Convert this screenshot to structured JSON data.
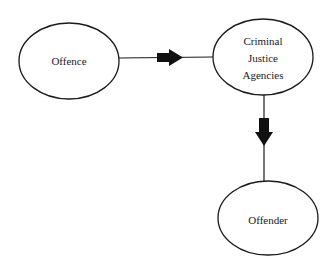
{
  "diagram": {
    "type": "flow",
    "nodes": [
      {
        "id": "offence",
        "label": "Offence",
        "shape": "ellipse",
        "cx": 69,
        "cy": 61,
        "rx": 50,
        "ry": 38
      },
      {
        "id": "cja",
        "label": "Criminal\nJustice\nAgencies",
        "shape": "ellipse",
        "cx": 263,
        "cy": 57,
        "rx": 50,
        "ry": 38
      },
      {
        "id": "offender",
        "label": "Offender",
        "shape": "ellipse",
        "cx": 268,
        "cy": 218,
        "rx": 50,
        "ry": 37
      }
    ],
    "edges": [
      {
        "from": "offence",
        "to": "cja",
        "direction": "right",
        "arrow": "block"
      },
      {
        "from": "cja",
        "to": "offender",
        "direction": "down",
        "arrow": "block"
      }
    ],
    "colors": {
      "stroke": "#1a1a1a",
      "fill": "#ffffff",
      "arrow": "#111111"
    }
  }
}
